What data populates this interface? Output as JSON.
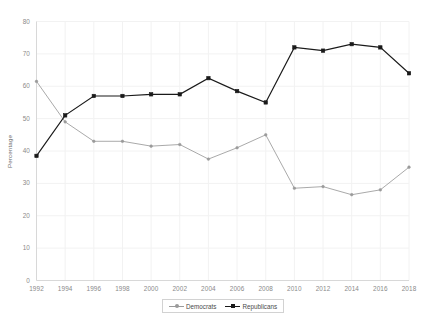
{
  "chart_data": {
    "type": "line",
    "title": "",
    "xlabel": "",
    "ylabel": "Percentage",
    "categories": [
      "1992",
      "1994",
      "1996",
      "1998",
      "2000",
      "2002",
      "2004",
      "2006",
      "2008",
      "2010",
      "2012",
      "2014",
      "2016",
      "2018"
    ],
    "xticks": [
      "1992",
      "1994",
      "1996",
      "1998",
      "2000",
      "2002",
      "2004",
      "2006",
      "2008",
      "2010",
      "2012",
      "2014",
      "2016",
      "2018"
    ],
    "yticks": [
      "0",
      "10",
      "20",
      "30",
      "40",
      "50",
      "60",
      "70",
      "80"
    ],
    "ylim": [
      0,
      80
    ],
    "xlim": [
      1992,
      2018
    ],
    "grid": true,
    "legend_position": "bottom-center",
    "series": [
      {
        "name": "Democrats",
        "color": "#9a9a9a",
        "marker": "dot",
        "values": [
          61.5,
          49,
          43,
          43,
          41.5,
          42,
          37.5,
          41,
          45,
          28.5,
          29,
          26.5,
          28,
          35
        ]
      },
      {
        "name": "Republicans",
        "color": "#1a1a1a",
        "marker": "square",
        "values": [
          38.5,
          51,
          57,
          57,
          57.5,
          57.5,
          62.5,
          58.5,
          55,
          72,
          71,
          73,
          72,
          64
        ]
      }
    ]
  },
  "colors": {
    "democrats": "#9a9a9a",
    "republicans": "#1a1a1a",
    "grid": "#f2f2f2",
    "axis": "#d8d8d8",
    "tick_text": "#8a8a8a",
    "background": "#ffffff"
  },
  "legend": {
    "items": [
      {
        "label": "Democrats"
      },
      {
        "label": "Republicans"
      }
    ]
  }
}
